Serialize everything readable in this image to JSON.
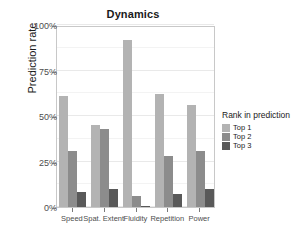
{
  "chart_data": {
    "type": "bar",
    "title": "Dynamics",
    "xlabel": "",
    "ylabel": "Prediction rate",
    "categories": [
      "Speed",
      "Spat. Extent",
      "Fluidity",
      "Repetition",
      "Power"
    ],
    "series": [
      {
        "name": "Top 1",
        "color": "#b3b3b3",
        "values": [
          61,
          45,
          92,
          62,
          56
        ]
      },
      {
        "name": "Top 2",
        "color": "#8c8c8c",
        "values": [
          31,
          43,
          6,
          28,
          31
        ]
      },
      {
        "name": "Top 3",
        "color": "#595959",
        "values": [
          8,
          10,
          0.5,
          7,
          10
        ]
      }
    ],
    "ylim": [
      0,
      100
    ],
    "y_ticks": [
      0,
      25,
      50,
      75,
      100
    ],
    "y_tick_labels": [
      "0%",
      "25%",
      "50%",
      "75%",
      "100%"
    ],
    "grid": true,
    "legend": {
      "title": "Rank in prediction",
      "position": "right",
      "entries": [
        "Top 1",
        "Top 2",
        "Top 3"
      ]
    }
  }
}
